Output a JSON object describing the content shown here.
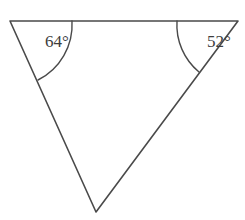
{
  "figure": {
    "kind": "geometry-diagram",
    "shape": "triangle",
    "background_color": "#ffffff",
    "stroke_color": "#4a4a4a",
    "text_color": "#3d3d3d"
  },
  "triangle": {
    "vertices": [
      {
        "name": "top-left",
        "x": 10,
        "y": 21
      },
      {
        "name": "top-right",
        "x": 238,
        "y": 21
      },
      {
        "name": "bottom",
        "x": 96,
        "y": 212
      }
    ],
    "sides": {
      "path": "M 10 21 L 238 21 L 96 212 Z"
    }
  },
  "angles": [
    {
      "id": "angle-top-left",
      "label": "64°",
      "value": 64,
      "unit": "degrees",
      "vertex": "top-left",
      "label_x": 45,
      "label_y": 47,
      "arc_path": "M 72 21 A 62 62 0 0 1 38 80"
    },
    {
      "id": "angle-top-right",
      "label": "52°",
      "value": 52,
      "unit": "degrees",
      "vertex": "top-right",
      "label_x": 207,
      "label_y": 47,
      "arc_path": "M 177 21 A 61 61 0 0 0 199 72"
    }
  ]
}
